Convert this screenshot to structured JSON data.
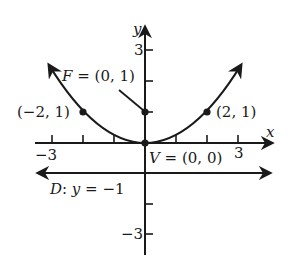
{
  "figure": {
    "type": "parabola-diagram",
    "equation": "x^2 = 4y",
    "colors": {
      "ink": "#1a1a1a",
      "background": "#ffffff"
    },
    "axes": {
      "x_label": "x",
      "y_label": "y",
      "x_tick_labels": {
        "neg": "−3",
        "pos": "3"
      },
      "y_tick_labels": {
        "pos": "3",
        "neg": "−3"
      },
      "x_range": [
        -3,
        3
      ],
      "y_range": [
        -3,
        3
      ]
    },
    "labels": {
      "focus": "F = (0, 1)",
      "focus_letter": "F",
      "focus_rest": " = (0, 1)",
      "vertex_letter": "V",
      "vertex_rest": " = (0, 0)",
      "left_point": "(−2, 1)",
      "right_point": "(2, 1)",
      "directrix_D": "D",
      "directrix_colon": ": ",
      "directrix_y": "y",
      "directrix_rest": " = −1"
    },
    "points": [
      {
        "name": "focus",
        "x": 0,
        "y": 1
      },
      {
        "name": "vertex",
        "x": 0,
        "y": 0
      },
      {
        "name": "left-point",
        "x": -2,
        "y": 1
      },
      {
        "name": "right-point",
        "x": 2,
        "y": 1
      }
    ],
    "directrix": {
      "y": -1
    }
  }
}
